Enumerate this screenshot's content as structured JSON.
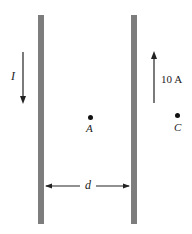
{
  "diagram": {
    "title": "",
    "wires": [
      {
        "id": "left-wire",
        "current_label": "I",
        "current_direction": "down"
      },
      {
        "id": "right-wire",
        "current_label": "10 A",
        "current_direction": "up"
      }
    ],
    "points": [
      {
        "id": "A",
        "label": "A",
        "location": "midway between wires"
      },
      {
        "id": "C",
        "label": "C",
        "location": "right of right wire"
      }
    ],
    "separation_label": "d",
    "colors": {
      "wire": "#7d7d7d",
      "ink": "#222222"
    }
  }
}
